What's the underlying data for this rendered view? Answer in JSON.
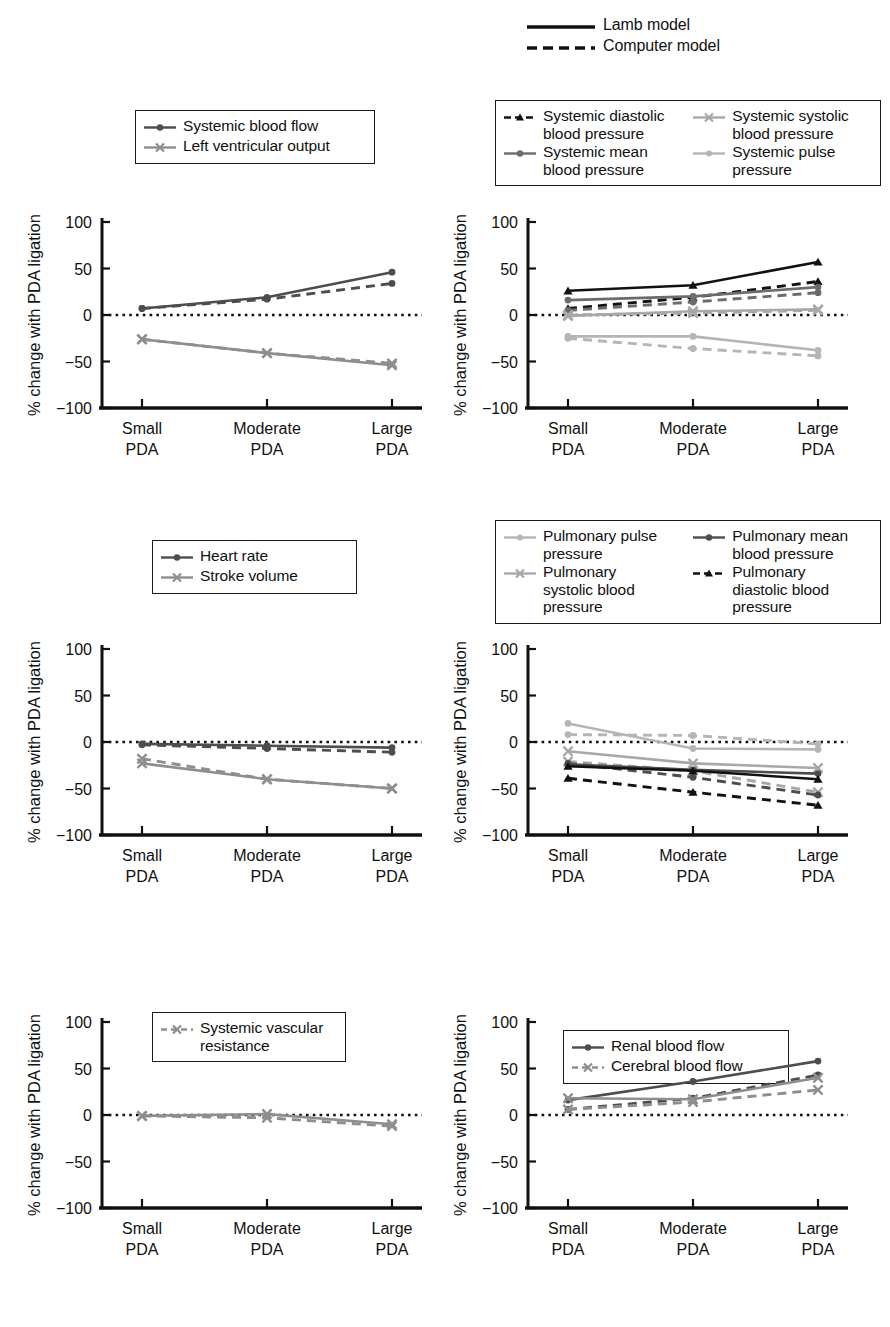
{
  "figure": {
    "axis_y_label": "% change with PDA ligation",
    "y_ticks": [
      "100",
      "50",
      "0",
      "−50",
      "−100"
    ],
    "y_tick_values": [
      100,
      50,
      0,
      -50,
      -100
    ],
    "x_ticks": [
      "Small\nPDA",
      "Moderate\nPDA",
      "Large\nPDA"
    ],
    "x_categories": [
      "Small PDA",
      "Moderate PDA",
      "Large PDA"
    ],
    "ylim": [
      -100,
      100
    ]
  },
  "model_legend": {
    "items": [
      {
        "label": "Lamb model",
        "style": "solid",
        "color": "#000000"
      },
      {
        "label": "Computer model",
        "style": "dashed",
        "color": "#000000"
      }
    ]
  },
  "colors": {
    "black": "#111111",
    "dark_gray": "#4d4d4d",
    "mid_gray": "#777777",
    "light_gray": "#a8a8a8",
    "pale_gray": "#bfbfbf",
    "axis": "#111111"
  },
  "panels": [
    {
      "id": "panel-systemic-flow",
      "position": "top-left",
      "legend": [
        {
          "label": "Systemic blood flow",
          "marker": "circle",
          "color": "#4d4d4d",
          "style": "solid"
        },
        {
          "label": "Left ventricular output",
          "marker": "cross",
          "color": "#8e8e8e",
          "style": "solid"
        }
      ],
      "chart_data": {
        "type": "line",
        "title": "",
        "xlabel": "",
        "ylabel": "% change with PDA ligation",
        "categories": [
          "Small PDA",
          "Moderate PDA",
          "Large PDA"
        ],
        "ylim": [
          -100,
          100
        ],
        "grid": false,
        "legend_position": "above-plot",
        "series": [
          {
            "name": "Systemic blood flow",
            "model": "Lamb model",
            "style": "solid",
            "marker": "circle",
            "color": "#4d4d4d",
            "values": [
              7,
              19,
              46
            ]
          },
          {
            "name": "Systemic blood flow",
            "model": "Computer model",
            "style": "dashed",
            "marker": "circle",
            "color": "#4d4d4d",
            "values": [
              7,
              17,
              34
            ]
          },
          {
            "name": "Left ventricular output",
            "model": "Lamb model",
            "style": "solid",
            "marker": "cross",
            "color": "#8e8e8e",
            "values": [
              -26,
              -41,
              -54
            ]
          },
          {
            "name": "Left ventricular output",
            "model": "Computer model",
            "style": "dashed",
            "marker": "cross",
            "color": "#8e8e8e",
            "values": [
              -26,
              -41,
              -52
            ]
          }
        ]
      }
    },
    {
      "id": "panel-systemic-pressure",
      "position": "top-right",
      "legend": [
        {
          "label": "Systemic diastolic\nblood pressure",
          "marker": "triangle",
          "color": "#111111",
          "style": "dashed"
        },
        {
          "label": "Systemic systolic\nblood pressure",
          "marker": "cross",
          "color": "#a8a8a8",
          "style": "solid"
        },
        {
          "label": "Systemic mean\nblood pressure",
          "marker": "circle",
          "color": "#6b6b6b",
          "style": "solid"
        },
        {
          "label": "Systemic pulse\npressure",
          "marker": "circle",
          "color": "#b5b5b5",
          "style": "solid"
        }
      ],
      "chart_data": {
        "type": "line",
        "title": "",
        "xlabel": "",
        "ylabel": "% change with PDA ligation",
        "categories": [
          "Small PDA",
          "Moderate PDA",
          "Large PDA"
        ],
        "ylim": [
          -100,
          100
        ],
        "grid": false,
        "legend_position": "above-plot",
        "series": [
          {
            "name": "Systemic diastolic blood pressure",
            "model": "Lamb model",
            "style": "solid",
            "marker": "triangle",
            "color": "#111111",
            "values": [
              26,
              32,
              57
            ]
          },
          {
            "name": "Systemic diastolic blood pressure",
            "model": "Computer model",
            "style": "dashed",
            "marker": "triangle",
            "color": "#111111",
            "values": [
              7,
              19,
              36
            ]
          },
          {
            "name": "Systemic mean blood pressure",
            "model": "Lamb model",
            "style": "solid",
            "marker": "circle",
            "color": "#6b6b6b",
            "values": [
              16,
              20,
              30
            ]
          },
          {
            "name": "Systemic mean blood pressure",
            "model": "Computer model",
            "style": "dashed",
            "marker": "circle",
            "color": "#6b6b6b",
            "values": [
              5,
              14,
              24
            ]
          },
          {
            "name": "Systemic systolic blood pressure",
            "model": "Lamb model",
            "style": "solid",
            "marker": "cross",
            "color": "#a8a8a8",
            "values": [
              -1,
              4,
              6
            ]
          },
          {
            "name": "Systemic systolic blood pressure",
            "model": "Computer model",
            "style": "dashed",
            "marker": "cross",
            "color": "#a8a8a8",
            "values": [
              0,
              2,
              5
            ]
          },
          {
            "name": "Systemic pulse pressure",
            "model": "Lamb model",
            "style": "solid",
            "marker": "circle",
            "color": "#b5b5b5",
            "values": [
              -23,
              -23,
              -38
            ]
          },
          {
            "name": "Systemic pulse pressure",
            "model": "Computer model",
            "style": "dashed",
            "marker": "circle",
            "color": "#b5b5b5",
            "values": [
              -25,
              -36,
              -44
            ]
          }
        ]
      }
    },
    {
      "id": "panel-heart-rate",
      "position": "middle-left",
      "legend": [
        {
          "label": "Heart rate",
          "marker": "circle",
          "color": "#4d4d4d",
          "style": "solid"
        },
        {
          "label": "Stroke volume",
          "marker": "cross",
          "color": "#8e8e8e",
          "style": "solid"
        }
      ],
      "chart_data": {
        "type": "line",
        "title": "",
        "xlabel": "",
        "ylabel": "% change with PDA ligation",
        "categories": [
          "Small PDA",
          "Moderate PDA",
          "Large PDA"
        ],
        "ylim": [
          -100,
          100
        ],
        "grid": false,
        "legend_position": "above-plot",
        "series": [
          {
            "name": "Heart rate",
            "model": "Lamb model",
            "style": "solid",
            "marker": "circle",
            "color": "#4d4d4d",
            "values": [
              -2,
              -4,
              -6
            ]
          },
          {
            "name": "Heart rate",
            "model": "Computer model",
            "style": "dashed",
            "marker": "circle",
            "color": "#4d4d4d",
            "values": [
              -3,
              -7,
              -11
            ]
          },
          {
            "name": "Stroke volume",
            "model": "Lamb model",
            "style": "solid",
            "marker": "cross",
            "color": "#8e8e8e",
            "values": [
              -23,
              -40,
              -50
            ]
          },
          {
            "name": "Stroke volume",
            "model": "Computer model",
            "style": "dashed",
            "marker": "cross",
            "color": "#8e8e8e",
            "values": [
              -18,
              -40,
              -50
            ]
          }
        ]
      }
    },
    {
      "id": "panel-pulmonary-pressure",
      "position": "middle-right",
      "legend": [
        {
          "label": "Pulmonary pulse\npressure",
          "marker": "circle",
          "color": "#b5b5b5",
          "style": "solid"
        },
        {
          "label": "Pulmonary mean\nblood pressure",
          "marker": "circle",
          "color": "#4d4d4d",
          "style": "solid"
        },
        {
          "label": "Pulmonary\nsystolic blood\npressure",
          "marker": "cross",
          "color": "#a8a8a8",
          "style": "solid"
        },
        {
          "label": "Pulmonary\ndiastolic blood\npressure",
          "marker": "triangle",
          "color": "#111111",
          "style": "dashed"
        }
      ],
      "chart_data": {
        "type": "line",
        "title": "",
        "xlabel": "",
        "ylabel": "% change with PDA ligation",
        "categories": [
          "Small PDA",
          "Moderate PDA",
          "Large PDA"
        ],
        "ylim": [
          -100,
          100
        ],
        "grid": false,
        "legend_position": "above-plot",
        "series": [
          {
            "name": "Pulmonary pulse pressure",
            "model": "Lamb model",
            "style": "solid",
            "marker": "circle",
            "color": "#b5b5b5",
            "values": [
              20,
              -7,
              -8
            ]
          },
          {
            "name": "Pulmonary pulse pressure",
            "model": "Computer model",
            "style": "dashed",
            "marker": "circle",
            "color": "#b5b5b5",
            "values": [
              8,
              7,
              -2
            ]
          },
          {
            "name": "Pulmonary systolic blood pressure",
            "model": "Lamb model",
            "style": "solid",
            "marker": "cross",
            "color": "#a8a8a8",
            "values": [
              -10,
              -23,
              -28
            ]
          },
          {
            "name": "Pulmonary systolic blood pressure",
            "model": "Computer model",
            "style": "dashed",
            "marker": "cross",
            "color": "#a8a8a8",
            "values": [
              -21,
              -31,
              -54
            ]
          },
          {
            "name": "Pulmonary mean blood pressure",
            "model": "Lamb model",
            "style": "solid",
            "marker": "circle",
            "color": "#4d4d4d",
            "values": [
              -24,
              -30,
              -34
            ]
          },
          {
            "name": "Pulmonary mean blood pressure",
            "model": "Computer model",
            "style": "dashed",
            "marker": "circle",
            "color": "#4d4d4d",
            "values": [
              -23,
              -38,
              -57
            ]
          },
          {
            "name": "Pulmonary diastolic blood pressure",
            "model": "Lamb model",
            "style": "solid",
            "marker": "triangle",
            "color": "#111111",
            "values": [
              -26,
              -31,
              -40
            ]
          },
          {
            "name": "Pulmonary diastolic blood pressure",
            "model": "Computer model",
            "style": "dashed",
            "marker": "triangle",
            "color": "#111111",
            "values": [
              -39,
              -54,
              -68
            ]
          }
        ]
      }
    },
    {
      "id": "panel-systemic-vascular-resistance",
      "position": "bottom-left",
      "legend": [
        {
          "label": "Systemic vascular\nresistance",
          "marker": "cross",
          "color": "#8e8e8e",
          "style": "dashed"
        }
      ],
      "chart_data": {
        "type": "line",
        "title": "",
        "xlabel": "",
        "ylabel": "% change with PDA ligation",
        "categories": [
          "Small PDA",
          "Moderate PDA",
          "Large PDA"
        ],
        "ylim": [
          -100,
          100
        ],
        "grid": false,
        "legend_position": "inside-top-left",
        "series": [
          {
            "name": "Systemic vascular resistance",
            "model": "Lamb model",
            "style": "solid",
            "marker": "cross",
            "color": "#8e8e8e",
            "values": [
              -1,
              1,
              -10
            ]
          },
          {
            "name": "Systemic vascular resistance",
            "model": "Computer model",
            "style": "dashed",
            "marker": "cross",
            "color": "#8e8e8e",
            "values": [
              -1,
              -3,
              -12
            ]
          }
        ]
      }
    },
    {
      "id": "panel-organ-blood-flow",
      "position": "bottom-right",
      "legend": [
        {
          "label": "Renal blood flow",
          "marker": "circle",
          "color": "#4d4d4d",
          "style": "solid"
        },
        {
          "label": "Cerebral blood flow",
          "marker": "cross",
          "color": "#8e8e8e",
          "style": "solid"
        }
      ],
      "chart_data": {
        "type": "line",
        "title": "",
        "xlabel": "",
        "ylabel": "% change with PDA ligation",
        "categories": [
          "Small PDA",
          "Moderate PDA",
          "Large PDA"
        ],
        "ylim": [
          -100,
          100
        ],
        "grid": false,
        "legend_position": "inside-top-left",
        "series": [
          {
            "name": "Renal blood flow",
            "model": "Lamb model",
            "style": "solid",
            "marker": "circle",
            "color": "#4d4d4d",
            "values": [
              16,
              36,
              58
            ]
          },
          {
            "name": "Renal blood flow",
            "model": "Computer model",
            "style": "dashed",
            "marker": "circle",
            "color": "#4d4d4d",
            "values": [
              6,
              18,
              43
            ]
          },
          {
            "name": "Cerebral blood flow",
            "model": "Lamb model",
            "style": "solid",
            "marker": "cross",
            "color": "#8e8e8e",
            "values": [
              18,
              17,
              40
            ]
          },
          {
            "name": "Cerebral blood flow",
            "model": "Computer model",
            "style": "dashed",
            "marker": "cross",
            "color": "#8e8e8e",
            "values": [
              6,
              14,
              27
            ]
          }
        ]
      }
    }
  ]
}
